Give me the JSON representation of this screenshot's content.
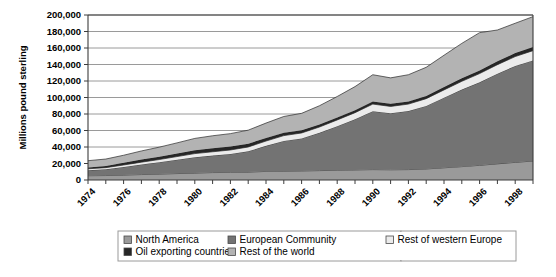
{
  "chart_data": {
    "type": "area",
    "title": "",
    "xlabel": "",
    "ylabel": "Millions pound sterling",
    "ylim": [
      0,
      200000
    ],
    "ytick_step": 20000,
    "grid": true,
    "stacked": true,
    "legend_position": "bottom",
    "x": [
      1974,
      1975,
      1976,
      1977,
      1978,
      1979,
      1980,
      1981,
      1982,
      1983,
      1984,
      1985,
      1986,
      1987,
      1988,
      1989,
      1990,
      1991,
      1992,
      1993,
      1994,
      1995,
      1996,
      1997,
      1998,
      1999
    ],
    "xtick_labels": [
      "1974",
      "",
      "1976",
      "",
      "1978",
      "",
      "1980",
      "",
      "1982",
      "",
      "1984",
      "",
      "1986",
      "",
      "1988",
      "",
      "1990",
      "",
      "1992",
      "",
      "1994",
      "",
      "1996",
      "",
      "1998",
      ""
    ],
    "ytick_labels": [
      "0",
      "20,000",
      "40,000",
      "60,000",
      "80,000",
      "100,000",
      "120,000",
      "140,000",
      "160,000",
      "180,000",
      "200,000"
    ],
    "ytick_values": [
      0,
      20000,
      40000,
      60000,
      80000,
      100000,
      120000,
      140000,
      160000,
      180000,
      200000
    ],
    "series": [
      {
        "name": "North America",
        "color": "#9a9a9a",
        "values": [
          5200,
          5400,
          6000,
          6600,
          7200,
          7800,
          8400,
          9000,
          9200,
          9600,
          10400,
          10800,
          11000,
          11400,
          11800,
          12200,
          12600,
          12400,
          12600,
          13400,
          14800,
          16200,
          17800,
          19600,
          21400,
          23000
        ]
      },
      {
        "name": "European Community",
        "color": "#737373",
        "values": [
          6600,
          7600,
          9800,
          12200,
          14400,
          16800,
          19200,
          20600,
          22400,
          25200,
          31000,
          36600,
          39400,
          45800,
          53400,
          61400,
          70800,
          68600,
          71000,
          76400,
          85000,
          93400,
          100600,
          109200,
          116800,
          122000
        ]
      },
      {
        "name": "Rest of western Europe",
        "color": "#ebebeb",
        "values": [
          1800,
          2000,
          2400,
          2800,
          3200,
          3800,
          4400,
          4600,
          4800,
          5200,
          5800,
          6400,
          6600,
          7000,
          7600,
          8000,
          8600,
          8200,
          8400,
          8800,
          9400,
          10000,
          10600,
          11000,
          11400,
          11800
        ]
      },
      {
        "name": "Oil exporting countries",
        "color": "#262626",
        "values": [
          1600,
          2000,
          2600,
          3200,
          3400,
          3600,
          4000,
          4200,
          4200,
          4000,
          3800,
          3600,
          3200,
          3000,
          3000,
          3000,
          3200,
          3200,
          3200,
          3200,
          3400,
          3600,
          3800,
          4000,
          4200,
          4400
        ]
      },
      {
        "name": "Rest of the world",
        "color": "#b3b3b3",
        "values": [
          8200,
          8400,
          9200,
          10400,
          11600,
          13000,
          14400,
          15200,
          15600,
          16400,
          18000,
          19600,
          20600,
          22800,
          25400,
          28600,
          32400,
          31400,
          32400,
          34800,
          38600,
          42400,
          45800,
          38000,
          36200,
          36800
        ]
      }
    ]
  },
  "legend": {
    "items": [
      {
        "label": "North America",
        "color": "#9a9a9a"
      },
      {
        "label": "European Community",
        "color": "#737373"
      },
      {
        "label": "Rest of western Europe",
        "color": "#ebebeb"
      },
      {
        "label": "Oil exporting countries",
        "color": "#262626"
      },
      {
        "label": "Rest of the world",
        "color": "#b3b3b3"
      }
    ]
  }
}
